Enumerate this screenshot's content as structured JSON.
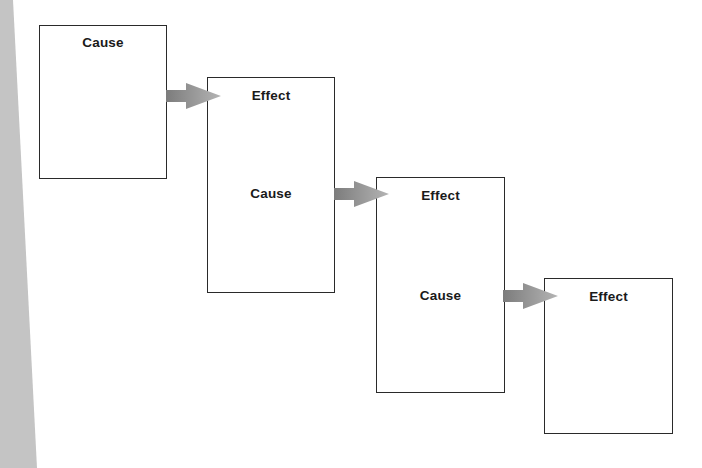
{
  "diagram": {
    "type": "cause-effect chain",
    "colors": {
      "background": "#ffffff",
      "side_strip": "#c4c4c4",
      "box_border": "#2a2a2a",
      "text": "#1a1a1a",
      "arrow_dark": "#7c7c7c",
      "arrow_light": "#b4b4b4"
    },
    "nodes": [
      {
        "id": "box-1",
        "labels": [
          "Cause"
        ]
      },
      {
        "id": "box-2",
        "labels": [
          "Effect",
          "Cause"
        ]
      },
      {
        "id": "box-3",
        "labels": [
          "Effect",
          "Cause"
        ]
      },
      {
        "id": "box-4",
        "labels": [
          "Effect"
        ]
      }
    ],
    "edges": [
      {
        "from": "box-1",
        "to": "box-2",
        "style": "gradient-block-arrow"
      },
      {
        "from": "box-2",
        "to": "box-3",
        "style": "gradient-block-arrow"
      },
      {
        "from": "box-3",
        "to": "box-4",
        "style": "gradient-block-arrow"
      }
    ]
  }
}
